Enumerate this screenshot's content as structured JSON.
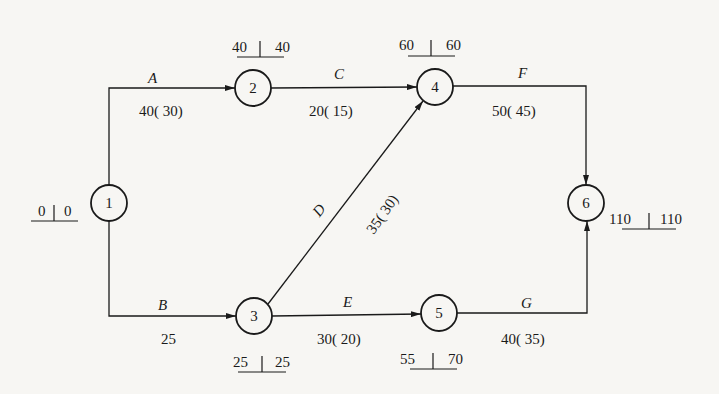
{
  "diagram": {
    "type": "activity-on-arrow network",
    "nodes": [
      {
        "id": "1",
        "label": "1",
        "x": 109,
        "y": 203,
        "time": {
          "left": "0",
          "right": "0"
        }
      },
      {
        "id": "2",
        "label": "2",
        "x": 253,
        "y": 88,
        "time": {
          "left": "40",
          "right": "40"
        }
      },
      {
        "id": "3",
        "label": "3",
        "x": 254,
        "y": 316,
        "time": {
          "left": "25",
          "right": "25"
        }
      },
      {
        "id": "4",
        "label": "4",
        "x": 435,
        "y": 87,
        "time": {
          "left": "60",
          "right": "60"
        }
      },
      {
        "id": "5",
        "label": "5",
        "x": 439,
        "y": 313,
        "time": {
          "left": "55",
          "right": "70"
        }
      },
      {
        "id": "6",
        "label": "6",
        "x": 586,
        "y": 203,
        "time": {
          "left": "110",
          "right": "110"
        }
      }
    ],
    "activities": [
      {
        "name": "A",
        "from": "1",
        "to": "2",
        "duration": "40( 30)"
      },
      {
        "name": "B",
        "from": "1",
        "to": "3",
        "duration": "25"
      },
      {
        "name": "C",
        "from": "2",
        "to": "4",
        "duration": "20( 15)"
      },
      {
        "name": "D",
        "from": "3",
        "to": "4",
        "duration": "35( 30)"
      },
      {
        "name": "E",
        "from": "3",
        "to": "5",
        "duration": "30( 20)"
      },
      {
        "name": "F",
        "from": "4",
        "to": "6",
        "duration": "50( 45)"
      },
      {
        "name": "G",
        "from": "5",
        "to": "6",
        "duration": "40( 35)"
      }
    ]
  }
}
